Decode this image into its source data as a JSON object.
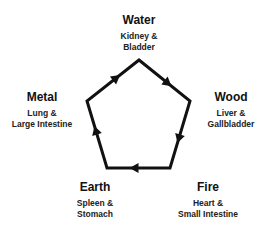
{
  "diagram": {
    "type": "cycle",
    "shape": "pentagon",
    "direction": "clockwise",
    "line_color": "#111111",
    "nodes": [
      {
        "element": "Water",
        "organ_line1": "Kidney &",
        "organ_line2": "Bladder"
      },
      {
        "element": "Wood",
        "organ_line1": "Liver &",
        "organ_line2": "Gallbladder"
      },
      {
        "element": "Fire",
        "organ_line1": "Heart &",
        "organ_line2": "Small Intestine"
      },
      {
        "element": "Earth",
        "organ_line1": "Spleen &",
        "organ_line2": "Stomach"
      },
      {
        "element": "Metal",
        "organ_line1": "Lung &",
        "organ_line2": "Large Intestine"
      }
    ],
    "edges": [
      {
        "from": "Water",
        "to": "Wood"
      },
      {
        "from": "Wood",
        "to": "Fire"
      },
      {
        "from": "Fire",
        "to": "Earth"
      },
      {
        "from": "Earth",
        "to": "Metal"
      },
      {
        "from": "Metal",
        "to": "Water"
      }
    ]
  }
}
